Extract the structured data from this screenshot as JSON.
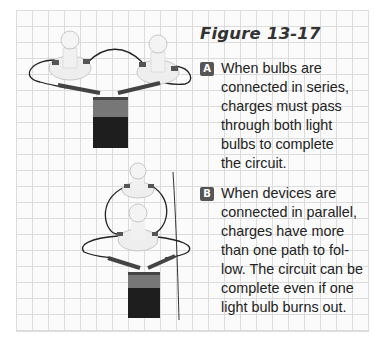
{
  "figure": {
    "title": "Figure 13-17",
    "captions": [
      {
        "label": "A",
        "lines": [
          "When bulbs are",
          "connected in series,",
          "charges must pass",
          "through both light",
          "bulbs to complete",
          "the circuit."
        ]
      },
      {
        "label": "B",
        "lines": [
          "When devices are",
          "connected in parallel,",
          "charges have more",
          "than one path to fol-",
          "low. The circuit can be",
          "complete even if one",
          "light bulb burns out."
        ]
      }
    ],
    "photos": [
      {
        "id": "series-circuit",
        "description": "Two light bulbs in holders side by side, wired in series to a 9-volt battery"
      },
      {
        "id": "parallel-circuit",
        "description": "Two light bulbs in holders stacked vertically, wired in parallel to a 9-volt battery"
      }
    ]
  },
  "colors": {
    "grid_line": "#dcdcdc",
    "badge": "#555555",
    "text": "#222222"
  }
}
